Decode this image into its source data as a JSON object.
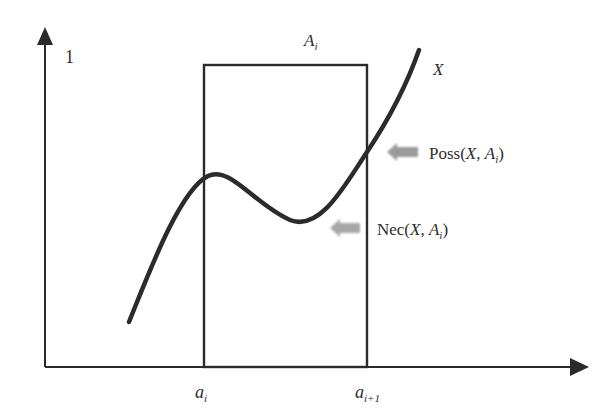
{
  "figure": {
    "y_axis_label": "1",
    "box_label": {
      "base": "A",
      "sub": "i"
    },
    "curve_label": "X",
    "poss_label": {
      "prefix": "Poss(",
      "x": "X",
      "sep": ", ",
      "a": "A",
      "sub": "i",
      "suffix": ")"
    },
    "nec_label": {
      "prefix": "Nec(",
      "x": "X",
      "sep": ", ",
      "a": "A",
      "sub": "i",
      "suffix": ")"
    },
    "x_tick_left": {
      "base": "a",
      "sub": "i"
    },
    "x_tick_right": {
      "base": "a",
      "sub": "i+1"
    },
    "colors": {
      "line": "#2b2b2b",
      "arrow_gray": "#9a9a9a"
    }
  }
}
